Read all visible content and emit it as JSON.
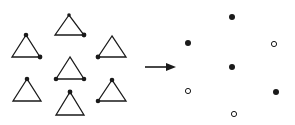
{
  "diagram": {
    "width": 295,
    "height": 125,
    "colors": {
      "stroke": "#1a1a1a",
      "fill_dot": "#1a1a1a",
      "open_dot_fill": "#ffffff"
    },
    "triangles": [
      {
        "id": "top",
        "apex": [
          69,
          15
        ],
        "bl": [
          55,
          35
        ],
        "br": [
          84,
          35
        ],
        "dots": [
          {
            "at": "apex",
            "r": 1.8
          },
          {
            "at": "br",
            "r": 2.4
          }
        ]
      },
      {
        "id": "upper-left",
        "apex": [
          26,
          35
        ],
        "bl": [
          12,
          57
        ],
        "br": [
          40,
          57
        ],
        "dots": [
          {
            "at": "apex",
            "r": 2.3
          },
          {
            "at": "br",
            "r": 2.4
          }
        ]
      },
      {
        "id": "upper-right",
        "apex": [
          112,
          36
        ],
        "bl": [
          98,
          57
        ],
        "br": [
          126,
          57
        ],
        "dots": [
          {
            "at": "bl",
            "r": 2.4
          }
        ]
      },
      {
        "id": "center",
        "apex": [
          70,
          57
        ],
        "bl": [
          56,
          79
        ],
        "br": [
          84,
          79
        ],
        "dots": [
          {
            "at": "bl",
            "r": 2.3
          },
          {
            "at": "br",
            "r": 2.3
          }
        ]
      },
      {
        "id": "lower-left",
        "apex": [
          27,
          79
        ],
        "bl": [
          13,
          101
        ],
        "br": [
          41,
          101
        ],
        "dots": [
          {
            "at": "apex",
            "r": 2.3
          }
        ]
      },
      {
        "id": "bottom",
        "apex": [
          70,
          92
        ],
        "bl": [
          56,
          115
        ],
        "br": [
          84,
          115
        ],
        "dots": [
          {
            "at": "apex",
            "r": 2.4
          }
        ]
      },
      {
        "id": "lower-right",
        "apex": [
          112,
          80
        ],
        "bl": [
          98,
          101
        ],
        "br": [
          126,
          101
        ],
        "dots": [
          {
            "at": "apex",
            "r": 2.3
          },
          {
            "at": "bl",
            "r": 2.3
          }
        ]
      }
    ],
    "arrow": {
      "from": [
        145,
        67
      ],
      "to": [
        176,
        67
      ]
    },
    "points": [
      {
        "id": "top",
        "x": 232,
        "y": 17,
        "filled": true
      },
      {
        "id": "upper-left",
        "x": 188,
        "y": 43,
        "filled": true
      },
      {
        "id": "upper-right",
        "x": 274,
        "y": 44,
        "filled": false
      },
      {
        "id": "center",
        "x": 232,
        "y": 67,
        "filled": true
      },
      {
        "id": "lower-left",
        "x": 188,
        "y": 91,
        "filled": false
      },
      {
        "id": "lower-right",
        "x": 276,
        "y": 92,
        "filled": true
      },
      {
        "id": "bottom",
        "x": 234,
        "y": 114,
        "filled": false
      }
    ]
  }
}
